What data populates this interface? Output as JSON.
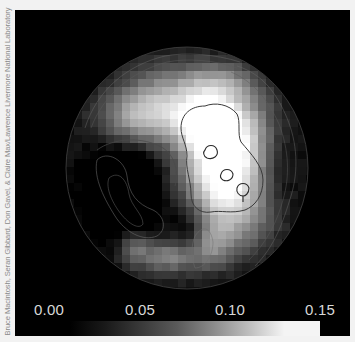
{
  "credit": "Bruce Macintosh, Seran Gibbard, Don Gavel, & Claire Max/Lawrence Livermore National Laboratory",
  "colorbar": {
    "ticks": [
      "0.00",
      "0.05",
      "0.10",
      "0.15"
    ],
    "range": [
      0.0,
      0.15
    ],
    "colormap": "grayscale black-to-white",
    "stops": [
      "#000000",
      "#1a1a1a",
      "#3a3a3a",
      "#5a5a5a",
      "#8a8a8a",
      "#bdbdbd",
      "#f4f4f4",
      "#f4f4f4"
    ]
  },
  "image": {
    "description": "Circular planetary-disk intensity map with pixelated grayscale values and overlaid contour lines",
    "disk_outline_color": "#3a3a3a",
    "contour_color": "#1a1a1a",
    "background": "#000000"
  }
}
